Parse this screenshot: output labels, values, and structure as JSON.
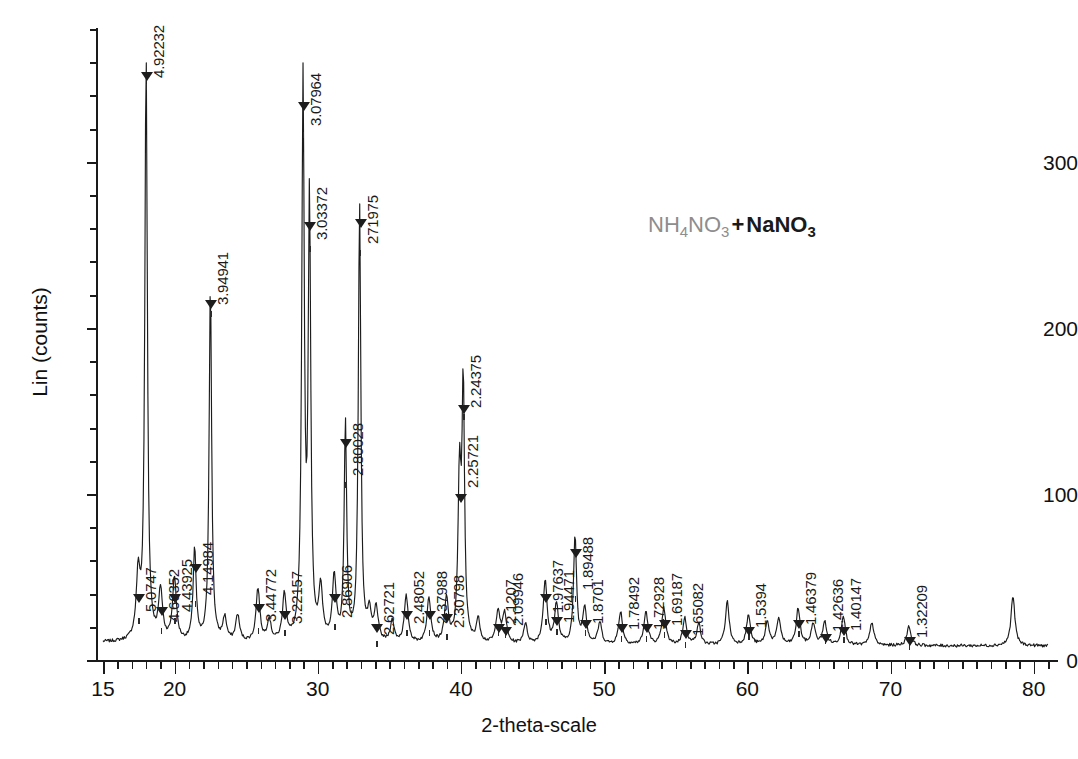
{
  "chart_data": {
    "type": "line",
    "title": "",
    "xlabel": "2-theta-scale",
    "ylabel": "Lin (counts)",
    "xlim": [
      15,
      81
    ],
    "ylim": [
      0,
      380
    ],
    "grid": false,
    "legend": "none",
    "annotation": {
      "text": "NH4NO3 + NaNO3",
      "parts": [
        {
          "t": "NH",
          "sub": false,
          "style": "dim"
        },
        {
          "t": "4",
          "sub": true,
          "style": "dim"
        },
        {
          "t": "NO",
          "sub": false,
          "style": "dim"
        },
        {
          "t": "3",
          "sub": true,
          "style": "dim"
        },
        {
          "t": "+",
          "sub": false,
          "style": "plus"
        },
        {
          "t": "NaNO",
          "sub": false,
          "style": "bold"
        },
        {
          "t": "3",
          "sub": true,
          "style": "bold"
        }
      ]
    },
    "y_ticks_major": [
      0,
      100,
      200,
      300
    ],
    "y_tick_labels": [
      "0",
      "100",
      "200",
      "300"
    ],
    "x_ticks_major": [
      15,
      20,
      30,
      40,
      50,
      60,
      70,
      80
    ],
    "x_tick_labels": [
      "15",
      "20",
      "30",
      "40",
      "50",
      "60",
      "70",
      "80"
    ],
    "peak_label_unit": "d-spacing (Angstrom)",
    "peaks": [
      {
        "label": "5.0747",
        "two_theta": 17.46,
        "height": 38,
        "label_top": 560,
        "leader_len": 52
      },
      {
        "label": "4.92232",
        "two_theta": 18.01,
        "height": 352,
        "label_top": 20,
        "leader_len": 58
      },
      {
        "label": "4.66352",
        "two_theta": 19.02,
        "height": 30,
        "label_top": 556,
        "leader_len": 66
      },
      {
        "label": "4.43925",
        "two_theta": 19.99,
        "height": 38,
        "label_top": 560,
        "leader_len": 52
      },
      {
        "label": "4.14984",
        "two_theta": 21.4,
        "height": 56,
        "label_top": 533,
        "leader_len": 62
      },
      {
        "label": "3.94941",
        "two_theta": 22.5,
        "height": 215,
        "label_top": 243,
        "leader_len": 62
      },
      {
        "label": "3.44772",
        "two_theta": 25.82,
        "height": 32,
        "label_top": 560,
        "leader_len": 62
      },
      {
        "label": "3.22157",
        "two_theta": 27.67,
        "height": 28,
        "label_top": 560,
        "leader_len": 64
      },
      {
        "label": "3.07964",
        "two_theta": 28.97,
        "height": 334,
        "label_top": 68,
        "leader_len": 58
      },
      {
        "label": "3.03372",
        "two_theta": 29.42,
        "height": 262,
        "label_top": 180,
        "leader_len": 60
      },
      {
        "label": "2.86906",
        "two_theta": 31.15,
        "height": 38,
        "label_top": 545,
        "leader_len": 73
      },
      {
        "label": "2.80028",
        "two_theta": 31.93,
        "height": 131,
        "label_top": 412,
        "leader_len": 64
      },
      {
        "label": "271975",
        "two_theta": 32.92,
        "height": 264,
        "label_top": 182,
        "leader_len": 62
      },
      {
        "label": "2.62721",
        "two_theta": 34.08,
        "height": 20,
        "label_top": 567,
        "leader_len": 68
      },
      {
        "label": "2.48052",
        "two_theta": 36.18,
        "height": 28,
        "label_top": 552,
        "leader_len": 72
      },
      {
        "label": "2.37988",
        "two_theta": 37.76,
        "height": 28,
        "label_top": 532,
        "leader_len": 92
      },
      {
        "label": "2.30798",
        "two_theta": 38.99,
        "height": 26,
        "label_top": 560,
        "leader_len": 68
      },
      {
        "label": "2.25721",
        "two_theta": 39.9,
        "height": 98,
        "label_top": 424,
        "leader_len": 64
      },
      {
        "label": "2.24375",
        "two_theta": 40.16,
        "height": 152,
        "label_top": 348,
        "leader_len": 60
      },
      {
        "label": "2.1207",
        "two_theta": 42.59,
        "height": 20,
        "label_top": 566,
        "leader_len": 58
      },
      {
        "label": "2.09946",
        "two_theta": 43.05,
        "height": 18,
        "label_top": 570,
        "leader_len": 56
      },
      {
        "label": "1.97637",
        "two_theta": 45.88,
        "height": 38,
        "label_top": 551,
        "leader_len": 62
      },
      {
        "label": "1.94471",
        "two_theta": 46.67,
        "height": 24,
        "label_top": 561,
        "leader_len": 62
      },
      {
        "label": "1.89488",
        "two_theta": 47.97,
        "height": 65,
        "label_top": 518,
        "leader_len": 72
      },
      {
        "label": "1.8701",
        "two_theta": 48.64,
        "height": 22,
        "label_top": 562,
        "leader_len": 62
      },
      {
        "label": "1.78492",
        "two_theta": 51.15,
        "height": 20,
        "label_top": 560,
        "leader_len": 70
      },
      {
        "label": "1.72928",
        "two_theta": 52.92,
        "height": 20,
        "label_top": 560,
        "leader_len": 70
      },
      {
        "label": "1.65082",
        "two_theta": 55.63,
        "height": 16,
        "label_top": 560,
        "leader_len": 76
      },
      {
        "label": "1.69187",
        "two_theta": 54.17,
        "height": 22,
        "label_top": 556,
        "leader_len": 70
      },
      {
        "label": "1.5394",
        "two_theta": 60.08,
        "height": 18,
        "label_top": 566,
        "leader_len": 62
      },
      {
        "label": "1.46379",
        "two_theta": 63.55,
        "height": 22,
        "label_top": 553,
        "leader_len": 72
      },
      {
        "label": "1.42636",
        "two_theta": 65.4,
        "height": 14,
        "label_top": 566,
        "leader_len": 66
      },
      {
        "label": "1.40147",
        "two_theta": 66.7,
        "height": 18,
        "label_top": 557,
        "leader_len": 74
      },
      {
        "label": "1.32209",
        "two_theta": 71.28,
        "height": 12,
        "label_top": 566,
        "leader_len": 72
      }
    ],
    "baseline_counts": 9,
    "unlabeled_peak_two_theta": [
      78.55
    ],
    "series": [
      {
        "name": "diffraction-trace",
        "description": "XRD intensity trace of NH4NO3 + NaNO3 mixture",
        "x_unit": "degrees 2-theta",
        "y_unit": "counts"
      }
    ]
  }
}
